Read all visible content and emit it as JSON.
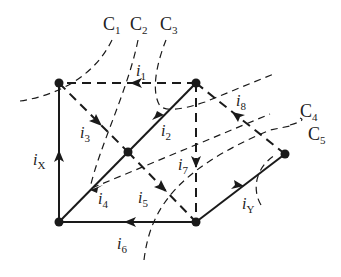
{
  "diagram": {
    "type": "circuit-graph-cutsets",
    "colors": {
      "ink": "#1a1a1a",
      "background": "#ffffff"
    },
    "nodes": [
      {
        "id": "TL",
        "x": 59,
        "y": 83
      },
      {
        "id": "TR",
        "x": 196,
        "y": 83
      },
      {
        "id": "M",
        "x": 128,
        "y": 152
      },
      {
        "id": "BL",
        "x": 59,
        "y": 222
      },
      {
        "id": "BR",
        "x": 196,
        "y": 222
      },
      {
        "id": "R",
        "x": 285,
        "y": 154
      }
    ],
    "branches": [
      {
        "id": "i1",
        "from": "TR",
        "to": "TL",
        "style": "dashed",
        "label": "i",
        "sub": "1"
      },
      {
        "id": "i2",
        "from": "M",
        "to": "TR",
        "style": "solid",
        "label": "i",
        "sub": "2"
      },
      {
        "id": "i3",
        "from": "TL",
        "to": "M",
        "style": "dashed",
        "label": "i",
        "sub": "3"
      },
      {
        "id": "i4",
        "from": "M",
        "to": "BL",
        "style": "solid",
        "label": "i",
        "sub": "4"
      },
      {
        "id": "i5",
        "from": "M",
        "to": "BR",
        "style": "dashed",
        "label": "i",
        "sub": "5"
      },
      {
        "id": "i6",
        "from": "BR",
        "to": "BL",
        "style": "solid",
        "label": "i",
        "sub": "6"
      },
      {
        "id": "i7",
        "from": "TR",
        "to": "BR",
        "style": "dashed",
        "label": "i",
        "sub": "7"
      },
      {
        "id": "i8",
        "from": "R",
        "to": "TR",
        "style": "dashed",
        "label": "i",
        "sub": "8"
      },
      {
        "id": "iX",
        "from": "BL",
        "to": "TL",
        "style": "solid",
        "label": "i",
        "sub": "X"
      },
      {
        "id": "iY",
        "from": "BR",
        "to": "R",
        "style": "solid",
        "label": "i",
        "sub": "Y"
      }
    ],
    "cutsets": [
      {
        "label": "C",
        "sub": "1"
      },
      {
        "label": "C",
        "sub": "2"
      },
      {
        "label": "C",
        "sub": "3"
      },
      {
        "label": "C",
        "sub": "4"
      },
      {
        "label": "C",
        "sub": "5"
      }
    ]
  }
}
